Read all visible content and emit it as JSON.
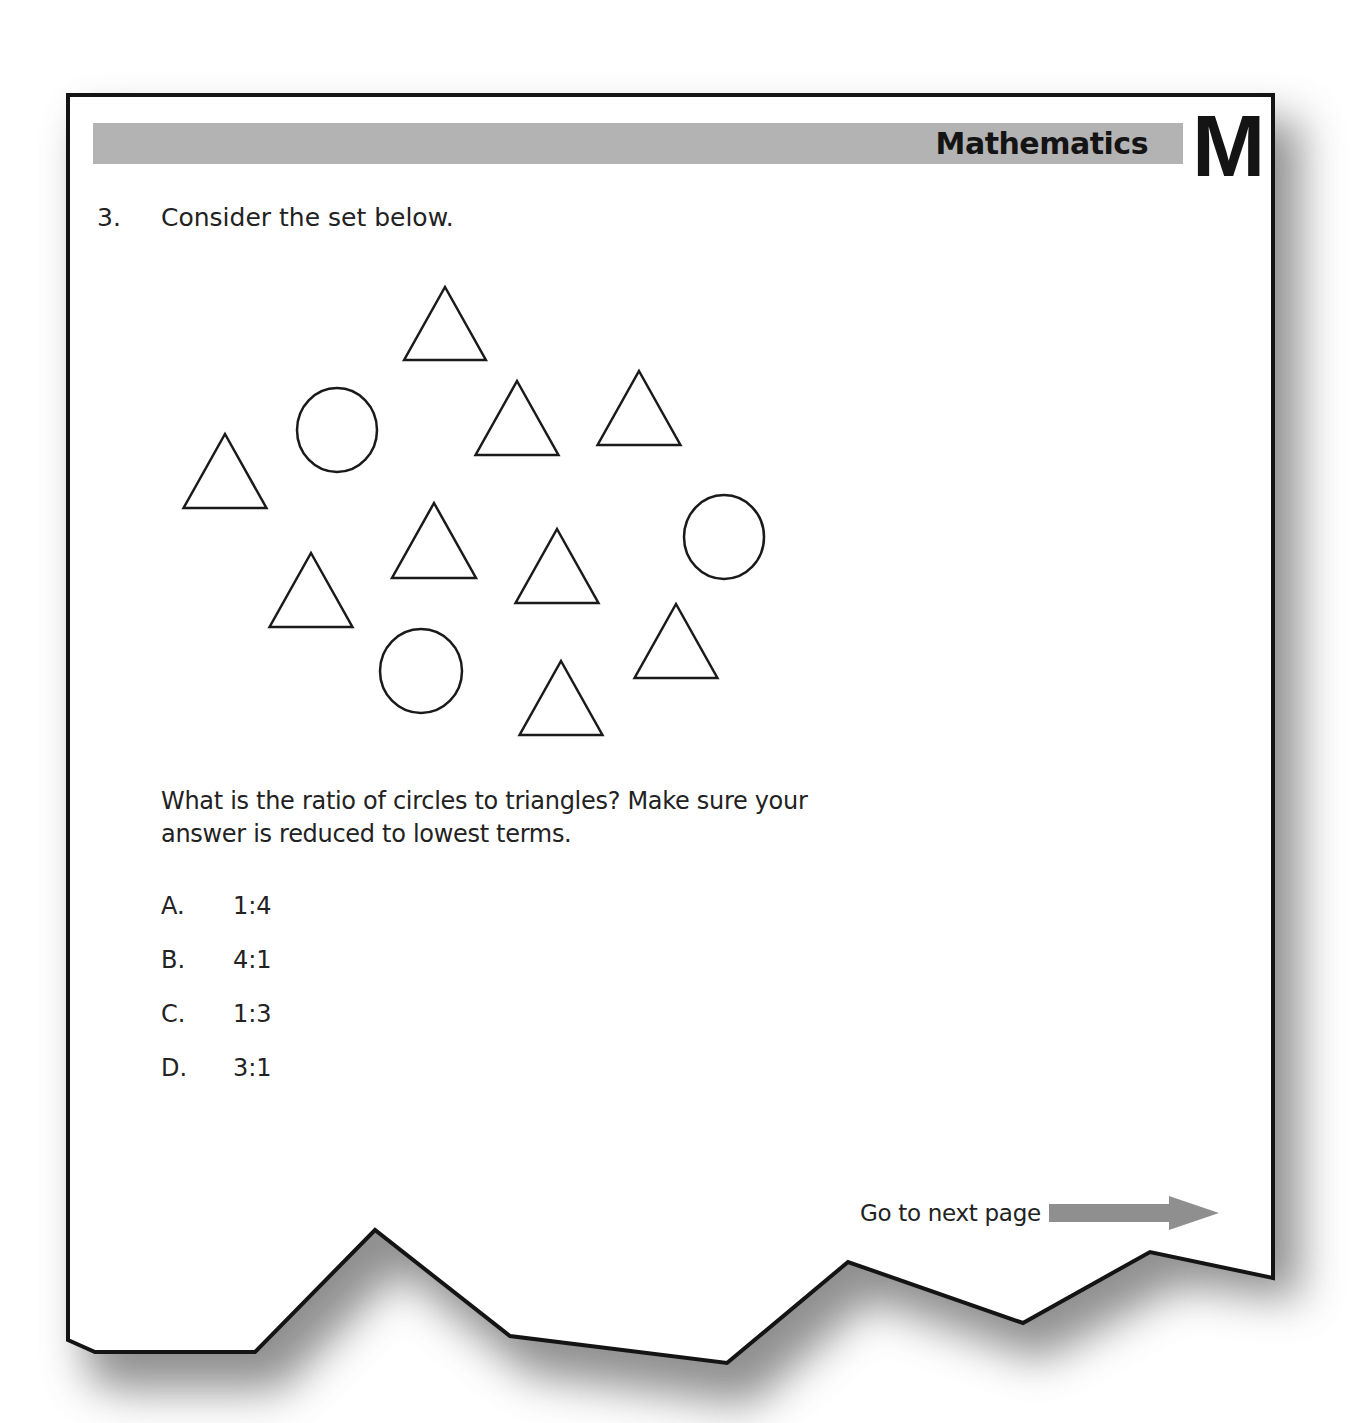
{
  "header": {
    "subject": "Mathematics",
    "subject_letter": "M",
    "bar_color": "#b3b3b3"
  },
  "question": {
    "number": "3.",
    "intro": "Consider the set below.",
    "prompt": "What is the ratio of circles to triangles? Make sure your answer is reduced to lowest terms.",
    "choices": [
      {
        "letter": "A.",
        "value": "1:4"
      },
      {
        "letter": "B.",
        "value": "4:1"
      },
      {
        "letter": "C.",
        "value": "1:3"
      },
      {
        "letter": "D.",
        "value": "3:1"
      }
    ]
  },
  "figure": {
    "triangle_count": 11,
    "circle_count": 3,
    "shapes": [
      {
        "type": "triangle",
        "cx": 445,
        "top": 287,
        "bottom": 360
      },
      {
        "type": "circle",
        "cx": 337,
        "cy": 430,
        "rx": 40,
        "ry": 42
      },
      {
        "type": "triangle",
        "cx": 517,
        "top": 381,
        "bottom": 455
      },
      {
        "type": "triangle",
        "cx": 639,
        "top": 371,
        "bottom": 445
      },
      {
        "type": "triangle",
        "cx": 225,
        "top": 434,
        "bottom": 508
      },
      {
        "type": "triangle",
        "cx": 434,
        "top": 503,
        "bottom": 578
      },
      {
        "type": "triangle",
        "cx": 557,
        "top": 529,
        "bottom": 603
      },
      {
        "type": "circle",
        "cx": 724,
        "cy": 537,
        "rx": 40,
        "ry": 42
      },
      {
        "type": "triangle",
        "cx": 311,
        "top": 553,
        "bottom": 627
      },
      {
        "type": "circle",
        "cx": 421,
        "cy": 671,
        "rx": 41,
        "ry": 42
      },
      {
        "type": "triangle",
        "cx": 676,
        "top": 604,
        "bottom": 678
      },
      {
        "type": "triangle",
        "cx": 561,
        "top": 661,
        "bottom": 735
      }
    ]
  },
  "footer": {
    "next_label": "Go to next page",
    "arrow_color": "#8f8f8f"
  }
}
